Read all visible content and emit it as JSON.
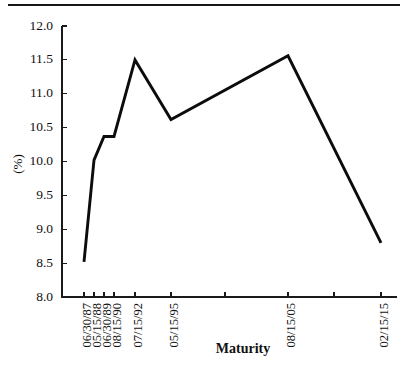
{
  "chart_data": {
    "type": "line",
    "title": "",
    "xlabel": "Maturity",
    "ylabel": "(%)",
    "ylim": [
      8.0,
      12.0
    ],
    "yticks": [
      "8.0",
      "8.5",
      "9.0",
      "9.5",
      "10.0",
      "10.5",
      "11.0",
      "11.5",
      "12.0"
    ],
    "ytick_values": [
      8.0,
      8.5,
      9.0,
      9.5,
      10.0,
      10.5,
      11.0,
      11.5,
      12.0
    ],
    "grid": false,
    "legend": "none",
    "categories": [
      "06/30/87",
      "05/15/88",
      "06/30/89",
      "08/15/90",
      "07/15/92",
      "05/15/95",
      "08/15/05",
      "02/15/15"
    ],
    "values": [
      8.52,
      10.02,
      10.37,
      10.37,
      11.5,
      10.62,
      11.56,
      8.8
    ],
    "series": [
      {
        "name": "yield",
        "points": [
          {
            "x": 84,
            "label": "06/30/87",
            "value": 8.52
          },
          {
            "x": 94,
            "label": "05/15/88",
            "value": 10.02
          },
          {
            "x": 104,
            "label": "06/30/89",
            "value": 10.37
          },
          {
            "x": 114,
            "label": "08/15/90",
            "value": 10.37
          },
          {
            "x": 135,
            "label": "07/15/92",
            "value": 11.5
          },
          {
            "x": 171,
            "label": "05/15/95",
            "value": 10.62
          },
          {
            "x": 288,
            "label": "08/15/05",
            "value": 11.56
          },
          {
            "x": 381,
            "label": "02/15/15",
            "value": 8.8
          }
        ]
      }
    ],
    "xticks": [
      {
        "x": 84,
        "label": "06/30/87"
      },
      {
        "x": 94,
        "label": "05/15/88"
      },
      {
        "x": 104,
        "label": "06/30/89"
      },
      {
        "x": 114,
        "label": "08/15/90"
      },
      {
        "x": 135,
        "label": "07/15/92"
      },
      {
        "x": 171,
        "label": "05/15/95"
      },
      {
        "x": 225,
        "label": ""
      },
      {
        "x": 288,
        "label": "08/15/05"
      },
      {
        "x": 334,
        "label": ""
      },
      {
        "x": 381,
        "label": "02/15/15"
      }
    ],
    "axis_colors": {
      "line": "#0c0c0c",
      "axis": "#1a1a1a",
      "text": "#111111",
      "background": "#ffffff"
    },
    "geometry": {
      "plot_left": 62,
      "plot_right": 397,
      "plot_top": 26,
      "plot_bottom": 297,
      "y_min": 8.0,
      "y_max": 12.0
    }
  }
}
